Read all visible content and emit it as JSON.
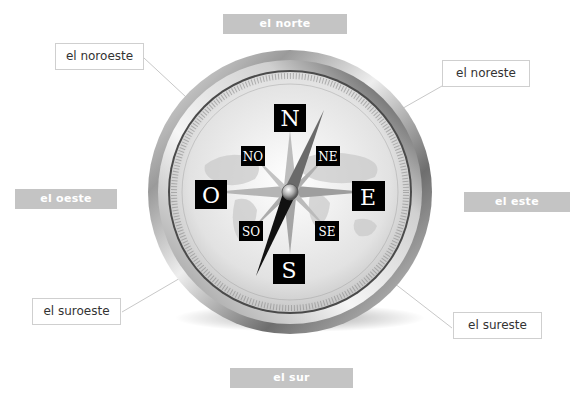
{
  "diagram": {
    "cardinal_labels": {
      "north": "el norte",
      "south": "el sur",
      "east": "el este",
      "west": "el oeste"
    },
    "intercardinal_labels": {
      "northwest": "el noroeste",
      "northeast": "el noreste",
      "southwest": "el suroeste",
      "southeast": "el sureste"
    },
    "compass_face": {
      "N": "N",
      "S": "S",
      "E": "E",
      "O": "O",
      "NO": "NO",
      "NE": "NE",
      "SO": "SO",
      "SE": "SE"
    },
    "colors": {
      "gray_label_bg": "#c4c4c4",
      "box_border": "#cfcfcf",
      "leader_line": "#c8c8c8",
      "marker_bg": "#000000"
    }
  }
}
